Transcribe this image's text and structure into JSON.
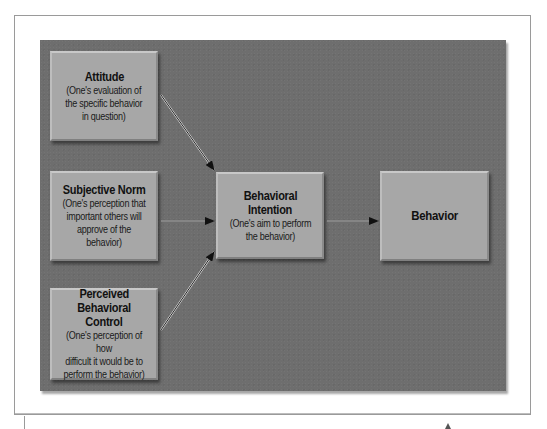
{
  "diagram": {
    "colors": {
      "panel": "#6e6e6e",
      "box": "#a7a7a7",
      "text": "#111111",
      "arrow": "#111111",
      "frame": "#9a9a9a"
    },
    "nodes": {
      "attitude": {
        "title": "Attitude",
        "description": "(One's evaluation of\nthe specific behavior\nin question)"
      },
      "subjective_norm": {
        "title": "Subjective Norm",
        "description": "(One's perception that\nimportant others will\napprove of the behavior)"
      },
      "perceived_control": {
        "title": "Perceived\nBehavioral Control",
        "title_line1": "Perceived",
        "title_line2": "Behavioral Control",
        "description": "(One's perception of how\ndifficult it would be to\nperform the behavior)"
      },
      "intention": {
        "title": "Behavioral\nIntention",
        "title_line1": "Behavioral",
        "title_line2": "Intention",
        "description": "(One's aim to perform\nthe behavior)"
      },
      "behavior": {
        "title": "Behavior"
      }
    },
    "edges": [
      {
        "from": "attitude",
        "to": "intention"
      },
      {
        "from": "subjective_norm",
        "to": "intention"
      },
      {
        "from": "perceived_control",
        "to": "intention"
      },
      {
        "from": "intention",
        "to": "behavior"
      }
    ]
  }
}
